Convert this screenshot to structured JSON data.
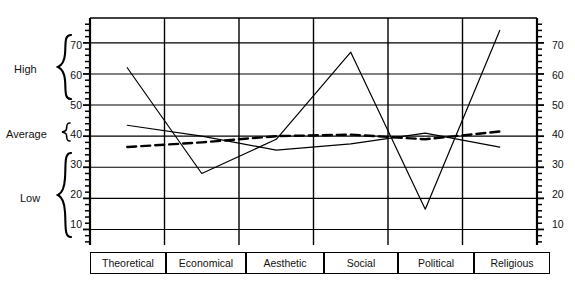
{
  "chart_data": {
    "type": "line",
    "title": "",
    "xlabel": "",
    "ylabel": "",
    "ylim": [
      5,
      78
    ],
    "grid": true,
    "legend_position": "none",
    "categories": [
      "Theoretical",
      "Economical",
      "Aesthetic",
      "Social",
      "Political",
      "Religious"
    ],
    "y_ticks": [
      10,
      20,
      30,
      40,
      50,
      60,
      70
    ],
    "minor_ticks": true,
    "band_labels": [
      {
        "name": "High",
        "range": [
          48,
          78
        ]
      },
      {
        "name": "Average",
        "range": [
          37,
          43
        ]
      },
      {
        "name": "Low",
        "range": [
          5,
          33
        ]
      }
    ],
    "series": [
      {
        "name": "series-1",
        "style": "solid",
        "values": [
          62,
          28,
          39,
          67,
          16.5,
          74
        ]
      },
      {
        "name": "series-2",
        "style": "solid",
        "values": [
          43.5,
          40,
          35.5,
          37.5,
          41,
          36.5
        ]
      },
      {
        "name": "series-3",
        "style": "dashed",
        "values": [
          36.5,
          38,
          40,
          40.5,
          39,
          41.5
        ]
      }
    ]
  },
  "axis": {
    "left_ticks": [
      "70",
      "60",
      "50",
      "40",
      "30",
      "20",
      "10"
    ],
    "right_ticks": [
      "70",
      "60",
      "50",
      "40",
      "30",
      "20",
      "10"
    ]
  },
  "bands": {
    "high": "High",
    "average": "Average",
    "low": "Low"
  },
  "categories": {
    "c0": "Theoretical",
    "c1": "Economical",
    "c2": "Aesthetic",
    "c3": "Social",
    "c4": "Political",
    "c5": "Religious"
  },
  "colors": {
    "ink": "#000000",
    "background": "#ffffff"
  }
}
